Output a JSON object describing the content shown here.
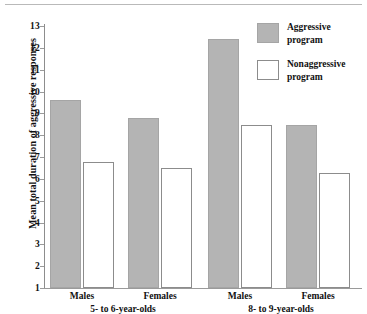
{
  "chart_data": {
    "type": "bar",
    "title": "",
    "xlabel": "",
    "ylabel": "Mean total duration of aggressive responses",
    "ylim": [
      1,
      13
    ],
    "ytick_labels": [
      "13",
      "12",
      "11",
      "10",
      "9",
      "8",
      "7",
      "6",
      "5",
      "4",
      "3",
      "2",
      "1"
    ],
    "ytick_values": [
      13,
      12,
      11,
      10,
      9,
      8,
      7,
      6,
      5,
      4,
      3,
      2,
      1
    ],
    "grid": false,
    "legend_position": "top-right",
    "categories": [
      "Males",
      "Females",
      "Males",
      "Females"
    ],
    "group_labels": [
      "5- to 6-year-olds",
      "8- to 9-year-olds"
    ],
    "series": [
      {
        "name": "Aggressive program",
        "color": "#b4b4b4",
        "style": "filled",
        "values": [
          9.6,
          8.8,
          12.4,
          8.45
        ]
      },
      {
        "name": "Nonaggressive program",
        "color": "#ffffff",
        "style": "hollow",
        "values": [
          6.75,
          6.5,
          8.45,
          6.25
        ]
      }
    ]
  },
  "legend": {
    "items": [
      {
        "label_line1": "Aggressive",
        "label_line2": "program",
        "style": "filled"
      },
      {
        "label_line1": "Nonaggressive",
        "label_line2": "program",
        "style": "hollow"
      }
    ]
  }
}
